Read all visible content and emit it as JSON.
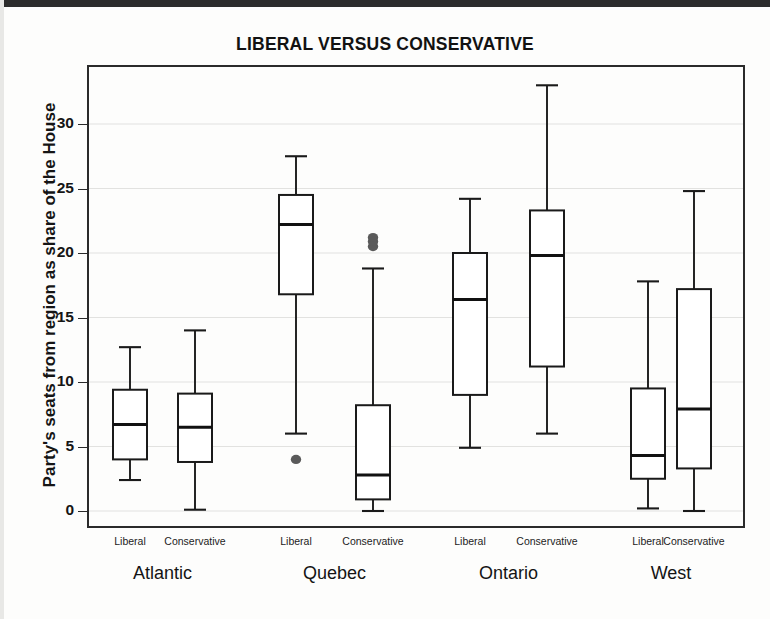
{
  "chart_data": {
    "type": "box",
    "title": "LIBERAL VERSUS CONSERVATIVE",
    "xlabel": "",
    "ylabel": "Party's seats from region as share of the House",
    "ylim": [
      -1.6,
      34.5
    ],
    "yticks": [
      0,
      5,
      10,
      15,
      20,
      25,
      30
    ],
    "ytick_labels": [
      "0",
      "5",
      "10",
      "15",
      "20",
      "25",
      "30"
    ],
    "grid": "horizontal",
    "legend": "none",
    "groups": [
      "Atlantic",
      "Quebec",
      "Ontario",
      "West"
    ],
    "categories": [
      "Liberal",
      "Conservative"
    ],
    "boxes": [
      {
        "group": "Atlantic",
        "party": "Liberal",
        "min": 2.4,
        "q1": 4.0,
        "median": 6.7,
        "q3": 9.4,
        "max": 12.7,
        "outliers": []
      },
      {
        "group": "Atlantic",
        "party": "Conservative",
        "min": 0.1,
        "q1": 3.8,
        "median": 6.5,
        "q3": 9.1,
        "max": 14.0,
        "outliers": []
      },
      {
        "group": "Quebec",
        "party": "Liberal",
        "min": 6.0,
        "q1": 16.8,
        "median": 22.2,
        "q3": 24.5,
        "max": 27.5,
        "outliers": [
          4.0
        ]
      },
      {
        "group": "Quebec",
        "party": "Conservative",
        "min": 0.0,
        "q1": 0.9,
        "median": 2.8,
        "q3": 8.2,
        "max": 18.8,
        "outliers": [
          20.5,
          20.9,
          21.2
        ]
      },
      {
        "group": "Ontario",
        "party": "Liberal",
        "min": 4.9,
        "q1": 9.0,
        "median": 16.4,
        "q3": 20.0,
        "max": 24.2,
        "outliers": []
      },
      {
        "group": "Ontario",
        "party": "Conservative",
        "min": 6.0,
        "q1": 11.2,
        "median": 19.8,
        "q3": 23.3,
        "max": 33.0,
        "outliers": []
      },
      {
        "group": "West",
        "party": "Liberal",
        "min": 0.2,
        "q1": 2.5,
        "median": 4.3,
        "q3": 9.5,
        "max": 17.8,
        "outliers": []
      },
      {
        "group": "West",
        "party": "Conservative",
        "min": 0.0,
        "q1": 3.3,
        "median": 7.9,
        "q3": 17.2,
        "max": 24.8,
        "outliers": []
      }
    ],
    "colors": {
      "box_stroke": "#1a1a1a",
      "box_fill": "#ffffff",
      "median": "#111111",
      "whisker": "#1a1a1a",
      "outlier": "#5a5a5a",
      "grid": "#e2e2e0",
      "frame": "#2b2b2b",
      "background": "#fdfdfc"
    }
  }
}
